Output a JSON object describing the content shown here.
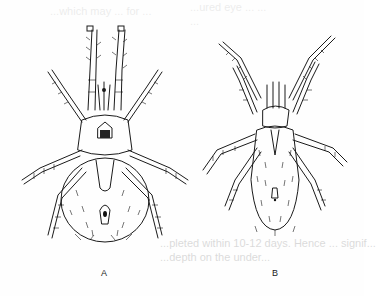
{
  "page": {
    "type": "scanned book page with figure",
    "background_bleed_text": [
      "...which may ... for ...",
      "...ured eye ... ...",
      "...",
      "...pleted within 10-12 days. Hence ... signif...",
      "...depth on the under..."
    ]
  },
  "figure": {
    "panels": [
      {
        "id": "A",
        "label": "A",
        "subject": "mite illustration, dorsal view, oval hairy body with ventral plates"
      },
      {
        "id": "B",
        "label": "B",
        "subject": "mite illustration, dorsal view, elongate densely setose body"
      }
    ]
  }
}
